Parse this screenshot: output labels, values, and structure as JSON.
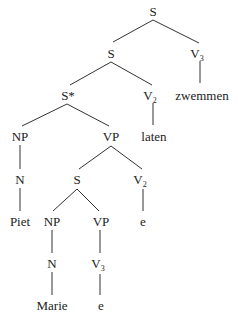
{
  "diagram": {
    "type": "syntax-tree",
    "nodes": {
      "root": {
        "label": "S",
        "sub": ""
      },
      "s2": {
        "label": "S",
        "sub": ""
      },
      "v3_top": {
        "label": "V",
        "sub": "3"
      },
      "zwemmen": {
        "label": "zwemmen",
        "sub": ""
      },
      "sstar": {
        "label": "S*",
        "sub": ""
      },
      "v2_mid": {
        "label": "V",
        "sub": "2"
      },
      "laten": {
        "label": "laten",
        "sub": ""
      },
      "np1": {
        "label": "NP",
        "sub": ""
      },
      "vp1": {
        "label": "VP",
        "sub": ""
      },
      "n1": {
        "label": "N",
        "sub": ""
      },
      "piet": {
        "label": "Piet",
        "sub": ""
      },
      "s3": {
        "label": "S",
        "sub": ""
      },
      "v2_low": {
        "label": "V",
        "sub": "2"
      },
      "e1": {
        "label": "e",
        "sub": ""
      },
      "np2": {
        "label": "NP",
        "sub": ""
      },
      "vp2": {
        "label": "VP",
        "sub": ""
      },
      "n2": {
        "label": "N",
        "sub": ""
      },
      "marie": {
        "label": "Marie",
        "sub": ""
      },
      "v3_low": {
        "label": "V",
        "sub": "3"
      },
      "e2": {
        "label": "e",
        "sub": ""
      }
    },
    "edges": [
      [
        "root",
        "s2"
      ],
      [
        "root",
        "v3_top"
      ],
      [
        "v3_top",
        "zwemmen"
      ],
      [
        "s2",
        "sstar"
      ],
      [
        "s2",
        "v2_mid"
      ],
      [
        "v2_mid",
        "laten"
      ],
      [
        "sstar",
        "np1"
      ],
      [
        "sstar",
        "vp1"
      ],
      [
        "np1",
        "n1"
      ],
      [
        "n1",
        "piet"
      ],
      [
        "vp1",
        "s3"
      ],
      [
        "vp1",
        "v2_low"
      ],
      [
        "v2_low",
        "e1"
      ],
      [
        "s3",
        "np2"
      ],
      [
        "s3",
        "vp2"
      ],
      [
        "np2",
        "n2"
      ],
      [
        "n2",
        "marie"
      ],
      [
        "vp2",
        "v3_low"
      ],
      [
        "v3_low",
        "e2"
      ]
    ]
  }
}
